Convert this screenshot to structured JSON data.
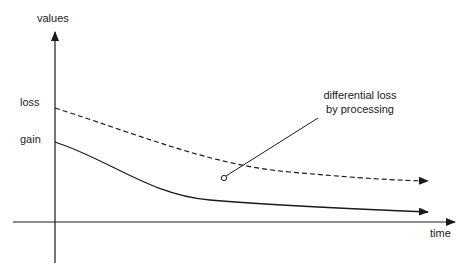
{
  "diagram": {
    "y_axis_label": "values",
    "x_axis_label": "time",
    "curves": [
      {
        "name": "loss",
        "label": "loss",
        "style": "dashed"
      },
      {
        "name": "gain",
        "label": "gain",
        "style": "solid"
      }
    ],
    "annotation": {
      "line1": "differential loss",
      "line2": "by processing"
    },
    "colors": {
      "ink": "#1a1a1a",
      "background": "#ffffff"
    }
  }
}
